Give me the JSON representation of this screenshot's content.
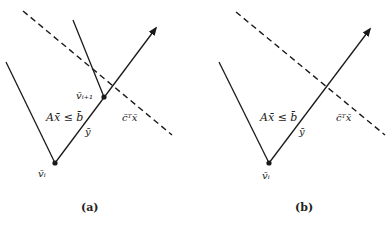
{
  "panels": [
    {
      "id": "a",
      "caption": "(a)",
      "labels": {
        "vertex": "v̄ᵢ",
        "next_vertex": "v̄ᵢ₊₁",
        "constraint": "Ax̄ ≤ b̄",
        "direction": "ȳ",
        "objective": "c̄ᵀx̄"
      }
    },
    {
      "id": "b",
      "caption": "(b)",
      "labels": {
        "vertex": "v̄ᵢ",
        "constraint": "Ax̄ ≤ b̄",
        "direction": "ȳ",
        "objective": "c̄ᵀx̄"
      }
    }
  ],
  "colors": {
    "stroke": "#1a1a1a",
    "text": "#222222",
    "background": "#ffffff"
  }
}
